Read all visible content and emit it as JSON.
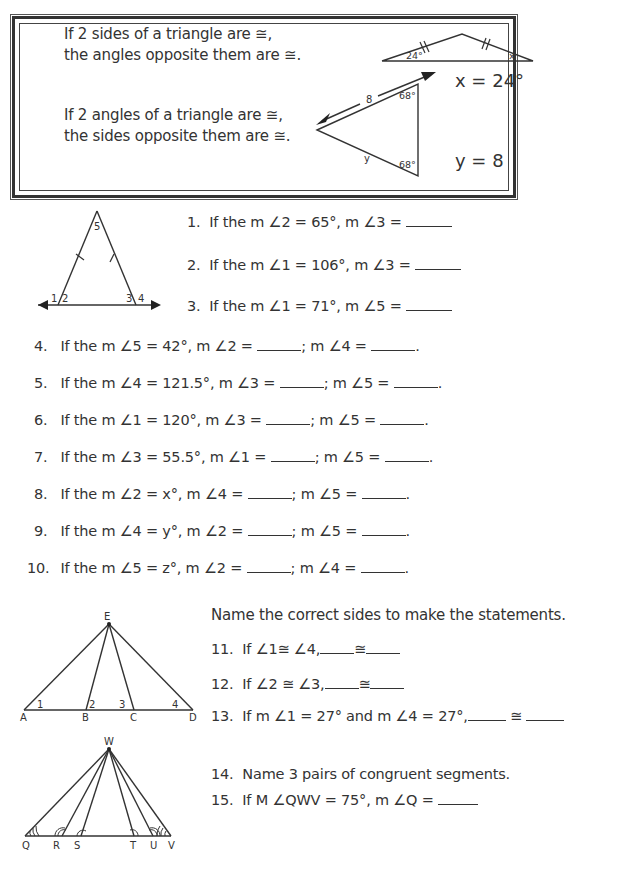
{
  "rules": {
    "sides_rule": {
      "line1": "If 2 sides of a triangle are ≅,",
      "line2": "the angles opposite them are ≅."
    },
    "angles_rule": {
      "line1": "If 2 angles of a triangle are ≅,",
      "line2": "the sides opposite them are ≅."
    },
    "example1": {
      "angle_label": "24°",
      "x_label": "x",
      "answer": "x = 24°"
    },
    "example2": {
      "side_label": "8",
      "y_label": "y",
      "angle_top": "68°",
      "angle_bottom": "68°",
      "answer": "y = 8"
    }
  },
  "figure1": {
    "labels": {
      "a1": "1",
      "a2": "2",
      "a3": "3",
      "a4": "4",
      "a5": "5"
    }
  },
  "questions_top": [
    {
      "num": "1.",
      "text": "If the m ∠2 = 65°, m ∠3 = "
    },
    {
      "num": "2.",
      "text": "If the m ∠1 = 106°, m ∠3 = "
    },
    {
      "num": "3.",
      "text": "If the m ∠1 = 71°, m ∠5 = "
    }
  ],
  "questions_mid": [
    {
      "num": "4.",
      "part1": "If the m ∠5 = 42°, m ∠2 = ",
      "part2": "; m ∠4 = ",
      "end": "."
    },
    {
      "num": "5.",
      "part1": "If the m ∠4 = 121.5°, m ∠3 = ",
      "part2": "; m ∠5 = ",
      "end": "."
    },
    {
      "num": "6.",
      "part1": "If the m ∠1 = 120°, m ∠3 = ",
      "part2": "; m ∠5 = ",
      "end": "."
    },
    {
      "num": "7.",
      "part1": "If the m ∠3 = 55.5°, m ∠1 = ",
      "part2": "; m ∠5 = ",
      "end": "."
    },
    {
      "num": "8.",
      "part1": "If the m ∠2 = x°, m ∠4 = ",
      "part2": "; m ∠5 = ",
      "end": "."
    },
    {
      "num": "9.",
      "part1": "If the m ∠4 = y°, m ∠2 = ",
      "part2": "; m ∠5 = ",
      "end": "."
    },
    {
      "num": "10.",
      "part1": "If the m ∠5 = z°, m ∠2 = ",
      "part2": "; m ∠4 = ",
      "end": "."
    }
  ],
  "figure2": {
    "points": {
      "E": "E",
      "A": "A",
      "B": "B",
      "C": "C",
      "D": "D"
    },
    "angles": {
      "a1": "1",
      "a2": "2",
      "a3": "3",
      "a4": "4"
    }
  },
  "section2": {
    "instruction": "Name the correct sides to make the statements.",
    "q11": {
      "num": "11.",
      "text": "If ∠1≅ ∠4,",
      "cong": "≅"
    },
    "q12": {
      "num": "12.",
      "text": "If ∠2 ≅ ∠3,",
      "cong": "≅"
    },
    "q13": {
      "num": "13.",
      "text": "If m ∠1 = 27° and m ∠4 = 27°,",
      "cong": "≅"
    }
  },
  "figure3": {
    "points": {
      "W": "W",
      "Q": "Q",
      "R": "R",
      "S": "S",
      "T": "T",
      "U": "U",
      "V": "V"
    }
  },
  "section3": {
    "q14": {
      "num": "14.",
      "text": "Name 3 pairs of congruent segments."
    },
    "q15": {
      "num": "15.",
      "text": "If M ∠QWV = 75°, m ∠Q = "
    }
  }
}
